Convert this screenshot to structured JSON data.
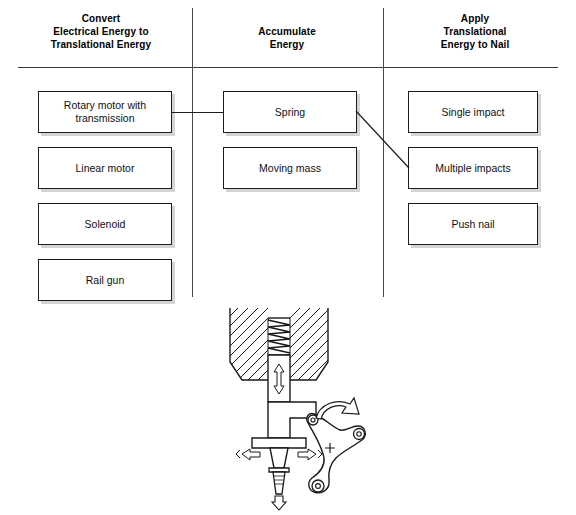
{
  "diagram": {
    "columns": [
      {
        "id": "convert",
        "header_lines": [
          "Convert",
          "Electrical Energy to",
          "Translational Energy"
        ],
        "options": [
          "Rotary motor with transmission",
          "Linear motor",
          "Solenoid",
          "Rail gun"
        ]
      },
      {
        "id": "accumulate",
        "header_lines": [
          "Accumulate",
          "Energy"
        ],
        "options": [
          "Spring",
          "Moving mass"
        ]
      },
      {
        "id": "apply",
        "header_lines": [
          "Apply",
          "Translational",
          "Energy to Nail"
        ],
        "options": [
          "Single impact",
          "Multiple impacts",
          "Push nail"
        ]
      }
    ],
    "connections": [
      {
        "from": "Rotary motor with transmission",
        "to": "Spring",
        "style": "horizontal"
      },
      {
        "from": "Spring",
        "to": "Multiple impacts",
        "style": "diagonal"
      }
    ],
    "colors": {
      "box_border": "#1d1d1d",
      "box_fill": "#ffffff",
      "box_shadow": "rgba(0,0,0,0.17)",
      "rule": "#3a3a3a",
      "divider": "#4a4a4a",
      "text": "#000000",
      "sketch_ink": "#1a1a1a"
    }
  },
  "sketch": {
    "name": "spring-loaded-hammer-concept-sketch",
    "parts": [
      "hatched housing",
      "compression spring",
      "reciprocating plunger",
      "striker head",
      "nail",
      "three-armed rocker crank"
    ],
    "annotations": [
      {
        "name": "plunger-double-arrow",
        "meaning": "up-down reciprocating motion"
      },
      {
        "name": "rotation-arrow",
        "meaning": "crank rotation"
      },
      {
        "name": "nail-drive-arrow",
        "meaning": "nail driven downward"
      },
      {
        "name": "impact-arrows",
        "meaning": "impact force at striker"
      },
      {
        "name": "pivot-cross-mark",
        "meaning": "crank centre"
      }
    ]
  }
}
